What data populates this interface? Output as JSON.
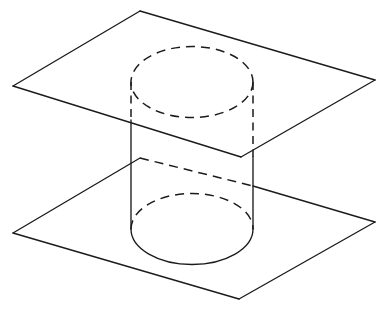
{
  "figure": {
    "background_color": "#ffffff",
    "line_color": "#1b1b1b",
    "line_width": 1.35,
    "hidden_line_dash": "9 6"
  },
  "geometry": {
    "upper_plane": {
      "label": "upper parallel plane",
      "corners": {
        "left": [
          13,
          86
        ],
        "top": [
          140,
          11
        ],
        "right": [
          375,
          80
        ],
        "bottom": [
          241,
          157
        ]
      },
      "visible_edges": [
        {
          "name": "left-back-edge",
          "from": [
            13,
            86
          ],
          "to": [
            140,
            11
          ],
          "style": "solid"
        },
        {
          "name": "right-back-edge",
          "from": [
            140,
            11
          ],
          "to": [
            375,
            80
          ],
          "style": "solid"
        },
        {
          "name": "right-front-edge",
          "from": [
            375,
            80
          ],
          "to": [
            241,
            157
          ],
          "style": "solid"
        },
        {
          "name": "left-front-edge",
          "from": [
            241,
            157
          ],
          "to": [
            13,
            86
          ],
          "style": "solid"
        }
      ]
    },
    "lower_plane": {
      "label": "lower parallel plane",
      "corners": {
        "left": [
          13,
          233
        ],
        "top": [
          140,
          158
        ],
        "right": [
          375,
          222
        ],
        "bottom": [
          239,
          299
        ]
      },
      "visible_edges": [
        {
          "name": "left-back-edge",
          "from": [
            13,
            233
          ],
          "to": [
            140,
            158
          ],
          "style": "solid"
        },
        {
          "name": "right-back-edge-hidden",
          "from": [
            140,
            158
          ],
          "to": [
            253,
            186
          ],
          "style": "dashed"
        },
        {
          "name": "right-back-edge-visible",
          "from": [
            253,
            186
          ],
          "to": [
            375,
            222
          ],
          "style": "solid"
        },
        {
          "name": "right-front-edge",
          "from": [
            375,
            222
          ],
          "to": [
            239,
            299
          ],
          "style": "solid"
        },
        {
          "name": "left-front-edge",
          "from": [
            239,
            299
          ],
          "to": [
            13,
            233
          ],
          "style": "solid"
        }
      ]
    },
    "cylinder": {
      "label": "right circular cylinder",
      "axis_x": 192,
      "radius_x": 61,
      "radius_y": 35.5,
      "top_ellipse": {
        "center": [
          192,
          82
        ],
        "rx": 61,
        "ry": 35.5,
        "style": "dashed",
        "note": "entire top circle hidden behind upper plane"
      },
      "bottom_ellipse": {
        "center": [
          192,
          229
        ],
        "rx": 61,
        "ry": 35.5,
        "back_half_style": "dashed",
        "front_half_style": "solid"
      },
      "left_silhouette": {
        "from": [
          131,
          82
        ],
        "to": [
          131,
          229
        ],
        "hidden_until_y": 120,
        "style_above": "dashed",
        "style_below": "solid"
      },
      "right_silhouette": {
        "from": [
          253,
          82
        ],
        "to": [
          253,
          229
        ],
        "hidden_until_y": 157,
        "style_above": "dashed",
        "style_below": "solid"
      }
    }
  },
  "legend": {
    "solid_meaning": "visible edge",
    "dashed_meaning": "hidden edge"
  },
  "captions": []
}
